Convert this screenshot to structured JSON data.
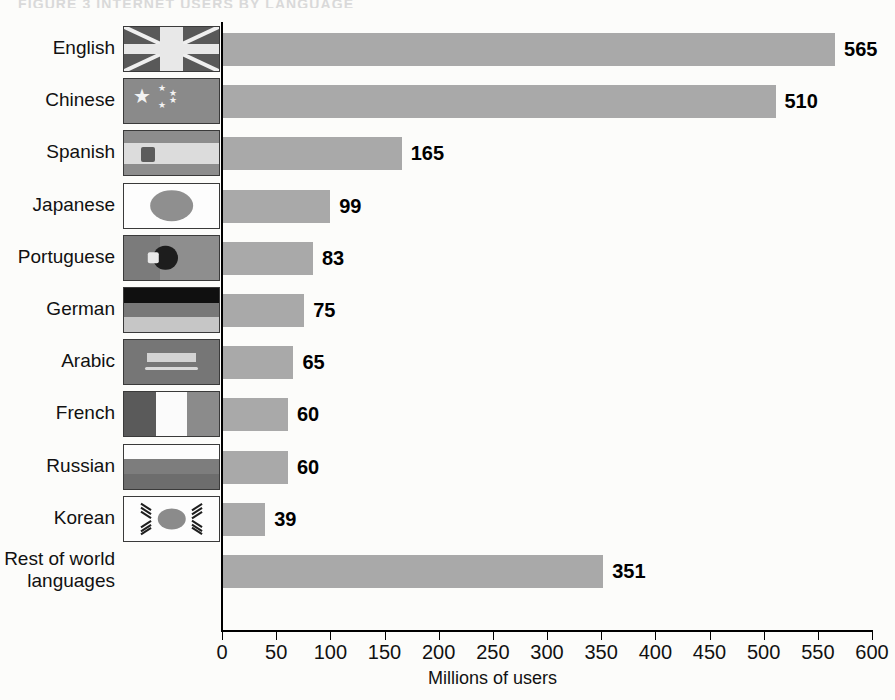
{
  "figure": {
    "caption": "FIGURE 3   INTERNET USERS BY LANGUAGE"
  },
  "chart_data": {
    "type": "bar",
    "orientation": "horizontal",
    "title": "",
    "xlabel": "Millions of users",
    "ylabel": "",
    "xlim": [
      0,
      600
    ],
    "xticks": [
      "0",
      "50",
      "100",
      "150",
      "200",
      "250",
      "300",
      "350",
      "400",
      "450",
      "500",
      "550",
      "600"
    ],
    "xtick_values": [
      0,
      50,
      100,
      150,
      200,
      250,
      300,
      350,
      400,
      450,
      500,
      550,
      600
    ],
    "grid": false,
    "legend": "none",
    "bar_color": "#a9a9a9",
    "categories": [
      "English",
      "Chinese",
      "Spanish",
      "Japanese",
      "Portuguese",
      "German",
      "Arabic",
      "French",
      "Russian",
      "Korean",
      "Rest of world\nlanguages"
    ],
    "values": [
      565,
      510,
      165,
      99,
      83,
      75,
      65,
      60,
      60,
      39,
      351
    ],
    "value_labels": [
      "565",
      "510",
      "165",
      "99",
      "83",
      "75",
      "65",
      "60",
      "60",
      "39",
      "351"
    ],
    "flags": [
      "flag-united-kingdom",
      "flag-china",
      "flag-spain",
      "flag-japan",
      "flag-portugal",
      "flag-germany",
      "flag-saudi-arabia",
      "flag-france",
      "flag-russia",
      "flag-south-korea",
      "none"
    ]
  }
}
